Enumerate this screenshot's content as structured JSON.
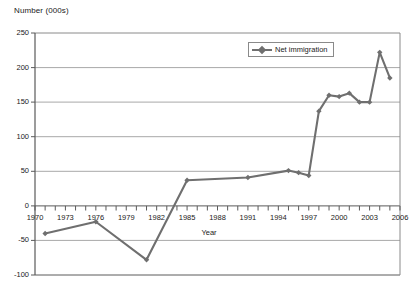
{
  "chart_data": {
    "type": "line",
    "title": "",
    "subtitle": "",
    "ylabel": "Number (000s)",
    "xlabel": "Year",
    "ylim": [
      -100,
      250
    ],
    "xlim": [
      1970,
      2006
    ],
    "ytick_step": 50,
    "xtick_step": 3,
    "grid": "horizontal",
    "legend_position": "top-center",
    "yticks": [
      "250",
      "200",
      "150",
      "100",
      "50",
      "0",
      "-50",
      "-100"
    ],
    "xticks": [
      "1970",
      "1973",
      "1976",
      "1979",
      "1982",
      "1985",
      "1988",
      "1991",
      "1994",
      "1997",
      "2000",
      "2003",
      "2006"
    ],
    "series": [
      {
        "name": "Net immigration",
        "color": "#6f6f6f",
        "marker": "diamond",
        "x": [
          1971,
          1976,
          1981,
          1985,
          1991,
          1995,
          1996,
          1997,
          1998,
          1999,
          2000,
          2001,
          2002,
          2003,
          2004,
          2005
        ],
        "values": [
          -40,
          -23,
          -78,
          37,
          41,
          51,
          48,
          44,
          137,
          160,
          158,
          163,
          150,
          150,
          222,
          185
        ]
      }
    ],
    "annotations": []
  },
  "legend": {
    "entries": [
      {
        "label": "Net immigration"
      }
    ]
  }
}
